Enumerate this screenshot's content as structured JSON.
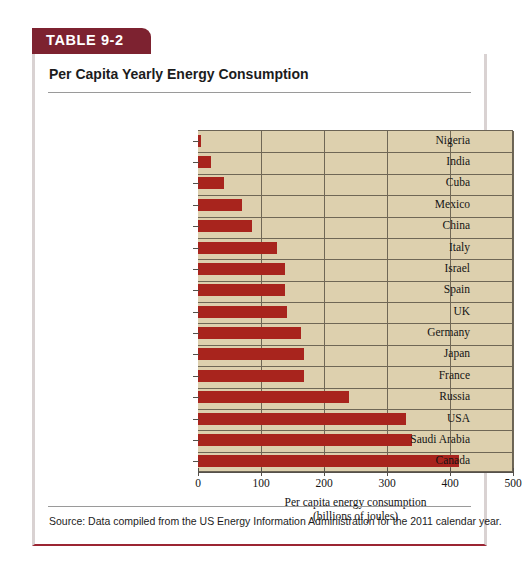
{
  "table": {
    "banner_label": "TABLE 9-2",
    "title": "Per Capita Yearly Energy Consumption",
    "source_note": "Source: Data compiled from the US Energy Information Administration for the 2011 calendar year.",
    "banner_color": "#7d2230",
    "bar_color": "#a8241d",
    "plot_background": "#ddd0ae"
  },
  "chart_data": {
    "type": "bar",
    "orientation": "horizontal",
    "title": "Per Capita Yearly Energy Consumption",
    "xlabel": "Per capita energy consumption",
    "xlabel_units": "(billions of joules)",
    "ylabel": "",
    "xlim": [
      0,
      500
    ],
    "xticks": [
      0,
      100,
      200,
      300,
      400,
      500
    ],
    "xtick_labels": [
      "0",
      "100",
      "200",
      "300",
      "400",
      "500"
    ],
    "grid": true,
    "legend": false,
    "categories": [
      "Nigeria",
      "India",
      "Cuba",
      "Mexico",
      "China",
      "Italy",
      "Israel",
      "Spain",
      "UK",
      "Germany",
      "Japan",
      "France",
      "Russia",
      "USA",
      "Saudi Arabia",
      "Canada"
    ],
    "values": [
      5,
      20,
      42,
      70,
      85,
      125,
      138,
      138,
      141,
      163,
      168,
      168,
      240,
      330,
      340,
      415
    ]
  }
}
